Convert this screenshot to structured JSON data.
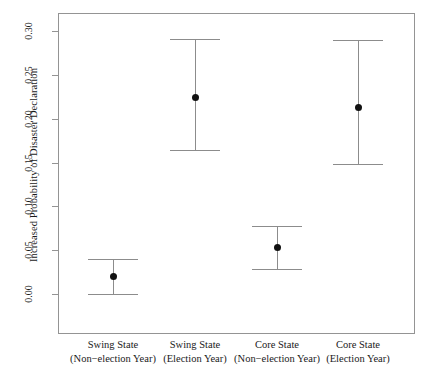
{
  "chart_data": {
    "type": "scatter",
    "title": "",
    "subtitle": "",
    "xlabel": "",
    "ylabel": "Increased Probability of Disaster Declaration",
    "ylim": [
      -0.018,
      0.348
    ],
    "yticks": [
      "0.00",
      "0.05",
      "0.10",
      "0.15",
      "0.20",
      "0.25",
      "0.30"
    ],
    "ytick_values": [
      0.0,
      0.05,
      0.1,
      0.15,
      0.2,
      0.25,
      0.3
    ],
    "grid": false,
    "legend": "none",
    "error_bar_style": "capped-vertical",
    "categories": [
      "Swing State (Non−election Year)",
      "Swing State (Election Year)",
      "Core State (Non−election Year)",
      "Core State (Election Year)"
    ],
    "category_lines": [
      [
        "Swing State",
        "(Non−election Year)"
      ],
      [
        "Swing State",
        "(Election Year)"
      ],
      [
        "Core State",
        "(Non−election Year)"
      ],
      [
        "Core State",
        "(Election Year)"
      ]
    ],
    "values": [
      0.02,
      0.224,
      0.053,
      0.213
    ],
    "ci_low": [
      0.0,
      0.164,
      0.029,
      0.148
    ],
    "ci_high": [
      0.04,
      0.291,
      0.077,
      0.29
    ],
    "points": [
      {
        "category": "Swing State (Non−election Year)",
        "estimate": 0.02,
        "ci_low": 0.0,
        "ci_high": 0.04
      },
      {
        "category": "Swing State (Election Year)",
        "estimate": 0.224,
        "ci_low": 0.164,
        "ci_high": 0.291
      },
      {
        "category": "Core State (Non−election Year)",
        "estimate": 0.053,
        "ci_low": 0.029,
        "ci_high": 0.077
      },
      {
        "category": "Core State (Election Year)",
        "estimate": 0.213,
        "ci_low": 0.148,
        "ci_high": 0.29
      }
    ],
    "colors": {
      "point": "#111111",
      "errorbar": "#8c8c8c",
      "frame": "#949494",
      "text": "#1a1a1a",
      "background": "#ffffff"
    }
  }
}
